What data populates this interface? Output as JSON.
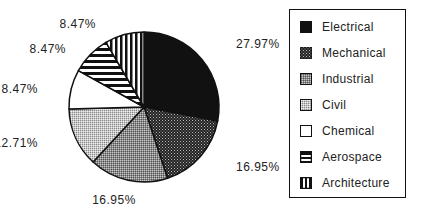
{
  "chart_data": {
    "type": "pie",
    "title": "",
    "categories": [
      "Electrical",
      "Mechanical",
      "Industrial",
      "Civil",
      "Chemical",
      "Aerospace",
      "Architecture"
    ],
    "values": [
      27.97,
      16.95,
      16.95,
      12.71,
      8.47,
      8.47,
      8.47
    ],
    "labels": [
      "27.97%",
      "16.95%",
      "16.95%",
      "12.71%",
      "8.47%",
      "8.47%",
      "8.47%"
    ],
    "start_angle": "12 o'clock",
    "direction": "clockwise",
    "legend_position": "right",
    "patterns": [
      "solid-black",
      "dense-dots",
      "medium-gray-dots",
      "light-gray-dots",
      "white",
      "horizontal-stripes",
      "vertical-stripes"
    ]
  },
  "legend": {
    "items": [
      {
        "label": "Electrical"
      },
      {
        "label": "Mechanical"
      },
      {
        "label": "Industrial"
      },
      {
        "label": "Civil"
      },
      {
        "label": "Chemical"
      },
      {
        "label": "Aerospace"
      },
      {
        "label": "Architecture"
      }
    ]
  },
  "slice_labels": {
    "electrical": "27.97%",
    "mechanical": "16.95%",
    "industrial": "16.95%",
    "civil": "12.71%",
    "chemical": "8.47%",
    "aerospace": "8.47%",
    "architecture": "8.47%"
  }
}
